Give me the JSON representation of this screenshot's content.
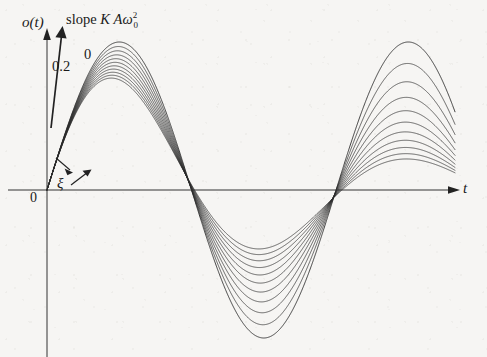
{
  "figure": {
    "background_color": "#f6f5f3",
    "ink_color": "#2a2a2a",
    "axis_color": "#333333"
  },
  "labels": {
    "y_axis": "o(t)",
    "x_axis": "t",
    "origin": "0",
    "slope_prefix": "slope",
    "slope_K": "K",
    "slope_A": "A",
    "slope_omega": "ω",
    "slope_omega_sub": "0",
    "slope_omega_sup": "2",
    "curve_top": "0",
    "curve_bottom": "0.2",
    "damping_symbol": "ξ",
    "damping_arrow": "↗"
  },
  "chart_data": {
    "type": "line",
    "title": "",
    "xlabel": "t",
    "ylabel": "o(t)",
    "annotations": [
      {
        "text": "slope K A ω₀²",
        "target": "initial slope of response at t=0"
      },
      {
        "text": "0",
        "target": "undamped curve, damping ratio zero"
      },
      {
        "text": "0.2",
        "target": "most damped curve, damping ratio 0.2"
      },
      {
        "text": "ξ ↗",
        "target": "direction of increasing damping ratio"
      }
    ],
    "grid": false,
    "legend_position": "inline-curve-labels",
    "axes": {
      "origin_px": {
        "x": 47,
        "y": 190
      },
      "x_axis_end_px": 455,
      "y_axis_top_px": 30,
      "x_range_units": [
        0,
        24
      ],
      "y_range_units": [
        -1.15,
        1.15
      ],
      "px_per_x_unit": 17.0,
      "px_per_y_unit": 148.0
    },
    "model": {
      "description": "Impulse response of a second-order system: o(t) = K A w0 /sqrt(1-z^2) * exp(-z*w0*t) * sin(w0*sqrt(1-z^2)*t), normalized so every curve starts with identical initial slope K A w0^2.",
      "omega0_units": 0.3695,
      "natural_period_px": 170,
      "initial_slope_shared": true
    },
    "series": [
      {
        "name": "ξ = 0",
        "damping_ratio": 0.0,
        "labeled": true,
        "label": "0",
        "peak_value": 1.0,
        "peak_px": {
          "x": 76,
          "y": 42
        }
      },
      {
        "name": "ξ = 0.02",
        "damping_ratio": 0.02,
        "labeled": false,
        "peak_value": 0.94
      },
      {
        "name": "ξ = 0.04",
        "damping_ratio": 0.04,
        "labeled": false,
        "peak_value": 0.88
      },
      {
        "name": "ξ = 0.06",
        "damping_ratio": 0.06,
        "labeled": false,
        "peak_value": 0.83
      },
      {
        "name": "ξ = 0.08",
        "damping_ratio": 0.08,
        "labeled": false,
        "peak_value": 0.78
      },
      {
        "name": "ξ = 0.10",
        "damping_ratio": 0.1,
        "labeled": false,
        "peak_value": 0.73
      },
      {
        "name": "ξ = 0.12",
        "damping_ratio": 0.12,
        "labeled": false,
        "peak_value": 0.69
      },
      {
        "name": "ξ = 0.14",
        "damping_ratio": 0.14,
        "labeled": false,
        "peak_value": 0.65
      },
      {
        "name": "ξ = 0.16",
        "damping_ratio": 0.16,
        "labeled": false,
        "peak_value": 0.61
      },
      {
        "name": "ξ = 0.18",
        "damping_ratio": 0.18,
        "labeled": false,
        "peak_value": 0.57
      },
      {
        "name": "ξ = 0.20",
        "damping_ratio": 0.2,
        "labeled": true,
        "label": "0.2",
        "peak_value": 0.54,
        "peak_px": {
          "x": 72,
          "y": 75
        }
      }
    ],
    "zero_crossings_px": [
      105,
      190,
      275,
      360,
      445
    ]
  }
}
